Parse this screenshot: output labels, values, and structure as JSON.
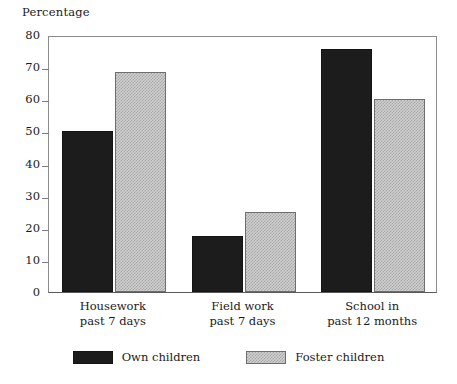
{
  "chart_data": {
    "type": "bar",
    "title": "",
    "ylabel": "Percentage",
    "xlabel": "",
    "ylim": [
      0,
      80
    ],
    "yticks": [
      0,
      10,
      20,
      30,
      40,
      50,
      60,
      70,
      80
    ],
    "ytick_labels": [
      "0",
      "10",
      "20",
      "30",
      "40",
      "50",
      "60",
      "70",
      "80"
    ],
    "grid": false,
    "legend_position": "bottom-center",
    "categories": [
      "Housework\npast 7 days",
      "Field work\npast 7 days",
      "School in\npast 12 months"
    ],
    "category_lines": [
      [
        "Housework",
        "past 7 days"
      ],
      [
        "Field work",
        "past 7 days"
      ],
      [
        "School in",
        "past 12 months"
      ]
    ],
    "series": [
      {
        "name": "Own children",
        "color": "#1c1c1c",
        "values": [
          50,
          17.5,
          75.5
        ]
      },
      {
        "name": "Foster children",
        "color": "#cfcfcf",
        "values": [
          68.5,
          25,
          60
        ]
      }
    ]
  },
  "legend": {
    "items": [
      {
        "label": "Own children",
        "style": "own"
      },
      {
        "label": "Foster children",
        "style": "foster"
      }
    ]
  }
}
